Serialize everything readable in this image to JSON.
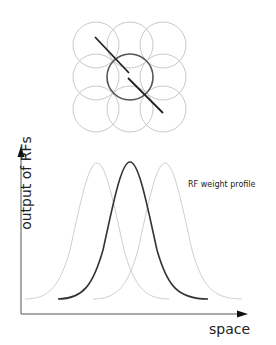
{
  "diagram": {
    "labels": {
      "y_axis": "output of RFs",
      "x_axis": "space",
      "curve_annotation": "RF weight profile"
    },
    "rf_grid": {
      "rows": 3,
      "cols": 3,
      "highlighted": "center",
      "colors": {
        "faint": "#c8c8c8",
        "highlight": "#555555",
        "stimulus_line": "#222222"
      }
    },
    "profiles": [
      {
        "name": "left RF",
        "peak_x": 97,
        "color": "#c8c8c8"
      },
      {
        "name": "center RF",
        "peak_x": 130,
        "color": "#333333"
      },
      {
        "name": "right RF",
        "peak_x": 165,
        "color": "#c8c8c8"
      }
    ]
  }
}
